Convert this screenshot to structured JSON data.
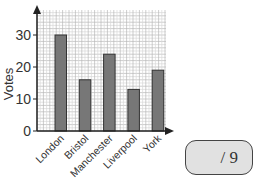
{
  "chart_data": {
    "type": "bar",
    "title": "",
    "xlabel": "",
    "ylabel": "Votes",
    "categories": [
      "London",
      "Bristol",
      "Manchester",
      "Liverpool",
      "York"
    ],
    "values": [
      30,
      16,
      24,
      13,
      19
    ],
    "ylim": [
      0,
      38
    ],
    "yticks": [
      0,
      10,
      20,
      30
    ],
    "grid": true,
    "bar_color": "#777777"
  },
  "y_ticks": {
    "t0": "0",
    "t10": "10",
    "t20": "20",
    "t30": "30"
  },
  "score_box": {
    "text": "/ 9"
  }
}
